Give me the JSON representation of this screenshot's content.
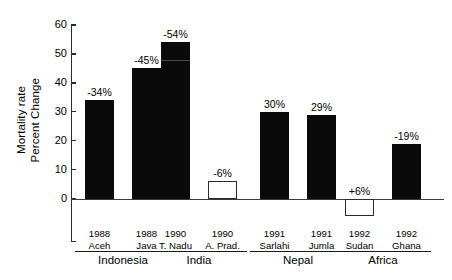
{
  "chart_data": {
    "type": "bar",
    "title": "",
    "xlabel": "",
    "ylabel_line1": "Mortality rate",
    "ylabel_line2": "Percent Change",
    "ylim": [
      0,
      60
    ],
    "yticks": [
      0,
      10,
      20,
      30,
      40,
      50,
      60
    ],
    "ytick_labels": [
      "0",
      "10",
      "20",
      "30",
      "40",
      "50",
      "60"
    ],
    "grid": false,
    "legend": "none",
    "categories": [
      "1988 Aceh",
      "1988 Java",
      "1990 T. Nadu",
      "1990 A. Prad.",
      "1991 Sarlahi",
      "1991 Jumla",
      "1992 Sudan",
      "1992 Ghana"
    ],
    "values": [
      34,
      45,
      54,
      6,
      30,
      29,
      -6,
      19
    ],
    "value_labels": [
      "-34%",
      "-45%",
      "-54%",
      "-6%",
      "30%",
      "29%",
      "+6%",
      "-19%"
    ],
    "bar_styles": [
      "filled",
      "filled",
      "filled",
      "hollow",
      "filled",
      "filled",
      "hollow",
      "filled"
    ],
    "annotations": []
  },
  "axis": {
    "title_line1": "Mortality rate",
    "title_line2": "Percent Change"
  },
  "bars": [
    {
      "year": "1988",
      "place": "Aceh",
      "label": "-34%",
      "value": 34,
      "style": "filled",
      "group": "Indonesia"
    },
    {
      "year": "1988",
      "place": "Java",
      "label": "-45%",
      "value": 45,
      "style": "filled",
      "group": "Indonesia"
    },
    {
      "year": "1990",
      "place": "T. Nadu",
      "label": "-54%",
      "value": 54,
      "style": "filled",
      "group": "India"
    },
    {
      "year": "1990",
      "place": "A. Prad.",
      "label": "-6%",
      "value": 6,
      "style": "hollow",
      "group": "India"
    },
    {
      "year": "1991",
      "place": "Sarlahi",
      "label": "30%",
      "value": 30,
      "style": "filled",
      "group": "Nepal"
    },
    {
      "year": "1991",
      "place": "Jumla",
      "label": "29%",
      "value": 29,
      "style": "filled",
      "group": "Nepal"
    },
    {
      "year": "1992",
      "place": "Sudan",
      "label": "+6%",
      "value": -6,
      "style": "hollow",
      "group": "Africa"
    },
    {
      "year": "1992",
      "place": "Ghana",
      "label": "-19%",
      "value": 19,
      "style": "filled",
      "group": "Africa"
    }
  ],
  "groups": [
    {
      "name": "Indonesia"
    },
    {
      "name": "India"
    },
    {
      "name": "Nepal"
    },
    {
      "name": "Africa"
    }
  ],
  "colors": {
    "bar_fill": "#0a0a0a",
    "bar_outline": "#2b2b2b",
    "axis": "#2b2b2b",
    "zero_line": "#3a3a3a",
    "text": "#000000",
    "background": "#ffffff"
  }
}
